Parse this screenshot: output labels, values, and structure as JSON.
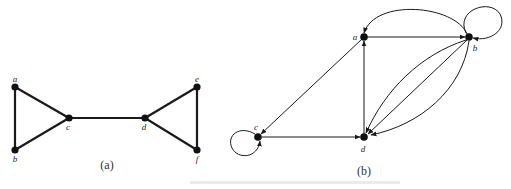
{
  "figures": [
    {
      "id": "a",
      "caption": "(a)",
      "type": "undirected",
      "nodes": [
        {
          "label": "a",
          "x": 15,
          "y": 87,
          "lx": 15,
          "ly": 82
        },
        {
          "label": "b",
          "x": 15,
          "y": 150,
          "lx": 15,
          "ly": 161
        },
        {
          "label": "c",
          "x": 69,
          "y": 118,
          "lx": 68,
          "ly": 129
        },
        {
          "label": "d",
          "x": 145,
          "y": 118,
          "lx": 144,
          "ly": 129
        },
        {
          "label": "e",
          "x": 197,
          "y": 87,
          "lx": 197,
          "ly": 82
        },
        {
          "label": "f",
          "x": 197,
          "y": 150,
          "lx": 197,
          "ly": 161
        }
      ],
      "edges": [
        [
          "a",
          "b"
        ],
        [
          "a",
          "c"
        ],
        [
          "b",
          "c"
        ],
        [
          "c",
          "d"
        ],
        [
          "d",
          "e"
        ],
        [
          "d",
          "f"
        ],
        [
          "e",
          "f"
        ]
      ]
    },
    {
      "id": "b",
      "caption": "(b)",
      "type": "directed",
      "nodes": [
        {
          "label": "a",
          "x": 364,
          "y": 37,
          "lx": 356,
          "ly": 39
        },
        {
          "label": "b",
          "x": 469,
          "y": 37,
          "lx": 475,
          "ly": 50
        },
        {
          "label": "c",
          "x": 258,
          "y": 137,
          "lx": 256,
          "ly": 129
        },
        {
          "label": "d",
          "x": 364,
          "y": 137,
          "lx": 363,
          "ly": 151
        }
      ],
      "edges": [
        {
          "from": "a",
          "to": "b",
          "shape": "straight"
        },
        {
          "from": "b",
          "to": "a",
          "shape": "arc-top"
        },
        {
          "from": "b",
          "to": "b",
          "shape": "loop"
        },
        {
          "from": "a",
          "to": "c",
          "shape": "straight"
        },
        {
          "from": "d",
          "to": "a",
          "shape": "straight"
        },
        {
          "from": "c",
          "to": "d",
          "shape": "straight"
        },
        {
          "from": "c",
          "to": "c",
          "shape": "loop"
        },
        {
          "from": "b",
          "to": "d",
          "shape": "curve-upper"
        },
        {
          "from": "b",
          "to": "d",
          "shape": "straight"
        },
        {
          "from": "b",
          "to": "d",
          "shape": "curve-lower"
        }
      ]
    }
  ],
  "captions": {
    "a": "(a)",
    "b": "(b)"
  },
  "colors": {
    "stroke": "#1a1a1a",
    "node": "#111111",
    "background": "#ffffff"
  }
}
